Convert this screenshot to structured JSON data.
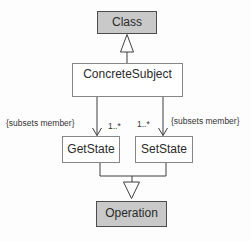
{
  "diagram": {
    "kind": "uml-class-diagram",
    "nodes": {
      "class": {
        "label": "Class"
      },
      "concrete_subject": {
        "label": "ConcreteSubject"
      },
      "get_state": {
        "label": "GetState"
      },
      "set_state": {
        "label": "SetState"
      },
      "operation": {
        "label": "Operation"
      }
    },
    "edges": {
      "constraint_left": "{subsets member}",
      "multiplicity_left": "1..*",
      "multiplicity_right": "1..*",
      "constraint_right": "{subsets member}"
    },
    "colors": {
      "highlight_node_fill": "#c9c9c9",
      "plain_node_fill": "#ffffff",
      "highlight_node_border": "#4c4c4c",
      "plain_node_border": "#868686",
      "line": "#3f3f3f",
      "text": "#2a2a2a",
      "background": "#fdfdfd"
    }
  }
}
